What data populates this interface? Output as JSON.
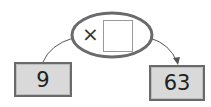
{
  "diagram": {
    "type": "function-machine",
    "operation": {
      "symbol": "×",
      "operand": ""
    },
    "input": "9",
    "output": "63"
  },
  "colors": {
    "box_fill": "#d9d9d9",
    "box_border": "#6a6a6a",
    "ellipse_border": "#6a6a6a",
    "line": "#555555"
  }
}
